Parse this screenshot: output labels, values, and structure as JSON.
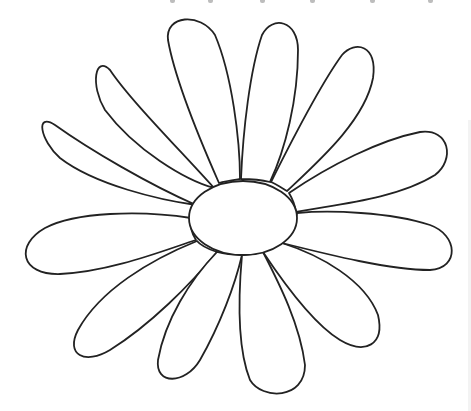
{
  "image": {
    "subject": "daisy flower line drawing",
    "width": 471,
    "height": 411,
    "background": "#ffffff",
    "line_color": "#222222",
    "petal_count": 12,
    "center": {
      "cx": 243,
      "cy": 218,
      "rx": 54,
      "ry": 37
    }
  },
  "petals": [
    {
      "name": "petal-upper-left-1",
      "d": "M196,205 C150,185 90,150 55,125 C35,112 40,140 60,158 C95,185 160,200 196,205 Z"
    },
    {
      "name": "petal-upper-left-2",
      "d": "M214,188 C180,150 130,100 110,70 C95,55 90,85 105,110 C135,150 185,180 214,188 Z"
    },
    {
      "name": "petal-upper-left-3",
      "d": "M219,183 C200,140 175,80 168,40 C165,15 200,12 215,35 C232,75 240,140 240,179 C233,180 225,181 219,183 Z"
    },
    {
      "name": "petal-upper-right-4",
      "d": "M241,179 C243,130 250,70 262,35 C272,15 298,20 298,50 C298,100 285,150 270,182 C262,180 250,179 241,179 Z"
    },
    {
      "name": "petal-upper-right-5",
      "d": "M271,182 C292,140 320,85 342,55 C355,40 378,45 373,78 C365,120 320,160 287,191 C282,188 276,184 271,182 Z"
    },
    {
      "name": "petal-right-6",
      "d": "M289,193 C330,165 380,140 420,132 C450,128 455,160 435,175 C395,200 330,205 296,212 C295,205 292,198 289,193 Z"
    },
    {
      "name": "petal-left-7",
      "d": "M191,218 C140,210 75,212 45,228 C15,245 20,275 60,274 C110,272 165,250 196,240 C192,234 190,226 191,218 Z"
    },
    {
      "name": "petal-lower-left-8",
      "d": "M197,241 C150,260 100,290 78,330 C65,355 85,365 110,350 C150,325 190,285 217,252 C208,249 201,246 197,241 Z"
    },
    {
      "name": "petal-lower-left-9",
      "d": "M217,252 C190,280 165,320 158,360 C155,385 185,385 200,360 C220,325 235,285 242,255 C232,255 224,254 217,252 Z"
    },
    {
      "name": "petal-lower-right-10",
      "d": "M242,255 C238,300 238,350 250,380 C262,400 305,400 305,365 C300,325 280,285 263,252 C256,254 249,255 242,255 Z"
    },
    {
      "name": "petal-lower-right-11",
      "d": "M263,252 C285,285 315,325 340,340 C365,355 385,345 378,315 C365,280 320,255 282,243 C276,247 270,250 263,252 Z"
    },
    {
      "name": "petal-right-12",
      "d": "M282,243 C330,255 390,270 430,270 C460,268 458,235 430,225 C390,212 330,210 297,213 C295,224 290,235 282,243 Z"
    }
  ]
}
